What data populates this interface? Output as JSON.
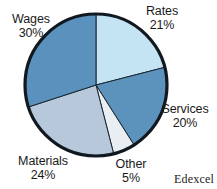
{
  "chart_data": {
    "type": "pie",
    "title": "",
    "categories": [
      "Rates",
      "Services",
      "Other",
      "Materials",
      "Wages"
    ],
    "values": [
      21,
      20,
      5,
      24,
      30
    ],
    "value_unit": "%",
    "start_angle_deg": 0,
    "direction": "clockwise",
    "legend_position": "outside-labels",
    "grid": false,
    "slices": [
      {
        "label": "Rates",
        "value": 21,
        "value_text": "21%",
        "color": "#c5e4f3",
        "start_deg": 0,
        "sweep_deg": 75.6
      },
      {
        "label": "Services",
        "value": 20,
        "value_text": "20%",
        "color": "#5b93bd",
        "start_deg": 75.6,
        "sweep_deg": 72.0
      },
      {
        "label": "Other",
        "value": 5,
        "value_text": "5%",
        "color": "#e8eef2",
        "start_deg": 147.6,
        "sweep_deg": 18.0
      },
      {
        "label": "Materials",
        "value": 24,
        "value_text": "24%",
        "color": "#b6c8da",
        "start_deg": 165.6,
        "sweep_deg": 86.4
      },
      {
        "label": "Wages",
        "value": 30,
        "value_text": "30%",
        "color": "#5a92bd",
        "start_deg": 252.0,
        "sweep_deg": 108.0
      }
    ],
    "geometry": {
      "cx": 96,
      "cy": 85,
      "r": 71,
      "outline_color": "#111820",
      "outline_width": 3.2,
      "divider_color": "#1a2430",
      "divider_width": 1.0
    }
  },
  "attribution": {
    "text": "Edexcel"
  }
}
